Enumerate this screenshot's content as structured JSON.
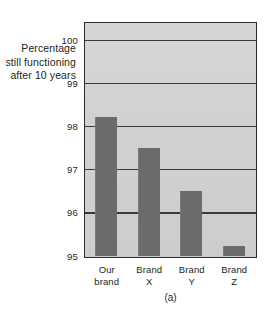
{
  "chart_data": {
    "type": "bar",
    "title": "",
    "caption": "(a)",
    "categories": [
      "Our brand",
      "Brand X",
      "Brand Y",
      "Brand Z"
    ],
    "category_lines": [
      [
        "Our",
        "brand"
      ],
      [
        "Brand",
        "X"
      ],
      [
        "Brand",
        "Y"
      ],
      [
        "Brand",
        "Z"
      ]
    ],
    "values": [
      98.23,
      97.5,
      96.5,
      95.23
    ],
    "xlabel": "",
    "ylabel": "Percentage still functioning after 10 years",
    "ylabel_lines": [
      "Percentage",
      "still functioning",
      "after 10 years"
    ],
    "ylim": [
      95,
      100.4
    ],
    "yticks": [
      100,
      99,
      98,
      97,
      96,
      95
    ],
    "ytick_labels": [
      "100",
      "99",
      "98",
      "97",
      "96",
      "95"
    ],
    "grid": true,
    "legend": "none",
    "colors": {
      "bar_fill": "#6b6b6b",
      "plot_background": "#d2d2d2",
      "gridline": "#3a3a3a",
      "frame": "#2c2c2c",
      "text": "#231f20",
      "page_background": "#ffffff"
    }
  }
}
